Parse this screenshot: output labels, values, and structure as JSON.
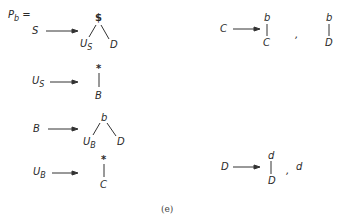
{
  "title": {
    "main": "P",
    "sub": "b",
    "eq": "="
  },
  "caption": "(e)",
  "productions": [
    {
      "lhs": "S",
      "root": "$",
      "children": [
        {
          "main": "U",
          "sub": "S"
        },
        {
          "main": "D",
          "sub": ""
        }
      ]
    },
    {
      "lhs": {
        "main": "U",
        "sub": "S"
      },
      "root": "*",
      "child": "B"
    },
    {
      "lhs": "B",
      "root": "b",
      "children": [
        {
          "main": "U",
          "sub": "B"
        },
        {
          "main": "D",
          "sub": ""
        }
      ]
    },
    {
      "lhs": {
        "main": "U",
        "sub": "B"
      },
      "root": "*",
      "child": "C"
    },
    {
      "lhs": "C",
      "alternatives": [
        {
          "root": "b",
          "child": "C"
        },
        {
          "root": "b",
          "child": "D"
        }
      ],
      "separator": ","
    },
    {
      "lhs": "D",
      "alternatives": [
        {
          "root": "d",
          "child": "D"
        },
        {
          "leaf": "d"
        }
      ],
      "separator": ","
    }
  ],
  "colors": {
    "ink": "#2a2a2a",
    "background": "#ffffff"
  }
}
